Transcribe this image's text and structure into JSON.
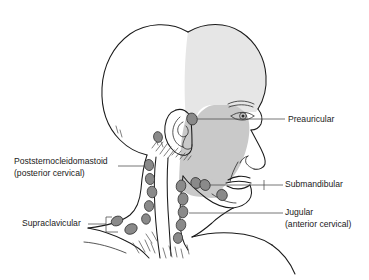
{
  "figure": {
    "colors": {
      "background": "#ffffff",
      "outline": "#1a1a1a",
      "node_fill": "#8a8a8a",
      "node_stroke": "#2f2f2f",
      "shade_light": "#e6e6e6",
      "shade_mid": "#c9c9c9",
      "leader_line": "#4a4a4a",
      "label_text": "#1a1a1a"
    }
  },
  "labels": [
    {
      "id": "preauricular",
      "line1": "Preauricular",
      "line2": "",
      "side": "right",
      "text_x": 288,
      "text_y": 120
    },
    {
      "id": "poststernocleidomastoid",
      "line1": "Poststernocleidomastoid",
      "line2": "(posterior cervical)",
      "side": "left",
      "text_x": 14,
      "text_y": 162
    },
    {
      "id": "submandibular",
      "line1": "Submandibular",
      "line2": "",
      "side": "right",
      "text_x": 285,
      "text_y": 185
    },
    {
      "id": "jugular",
      "line1": "Jugular",
      "line2": "(anterior cervical)",
      "side": "right",
      "text_x": 285,
      "text_y": 213
    },
    {
      "id": "supraclavicular",
      "line1": "Supraclavicular",
      "line2": "",
      "side": "left",
      "text_x": 22,
      "text_y": 224
    }
  ],
  "node_groups": [
    {
      "id": "preauricular",
      "count": 1,
      "nodes": [
        {
          "cx": 192,
          "cy": 119,
          "rx": 5.2,
          "ry": 6.0,
          "rot": -18
        }
      ]
    },
    {
      "id": "postauricular",
      "count": 1,
      "nodes": [
        {
          "cx": 158,
          "cy": 137,
          "rx": 4.4,
          "ry": 5.4,
          "rot": -12
        }
      ]
    },
    {
      "id": "poststernocleidomastoid",
      "count": 5,
      "nodes": [
        {
          "cx": 149,
          "cy": 165,
          "rx": 4.6,
          "ry": 5.6,
          "rot": -10
        },
        {
          "cx": 150,
          "cy": 179,
          "rx": 4.6,
          "ry": 5.6,
          "rot": -8
        },
        {
          "cx": 152,
          "cy": 192,
          "rx": 4.8,
          "ry": 5.8,
          "rot": -6
        },
        {
          "cx": 149,
          "cy": 206,
          "rx": 4.6,
          "ry": 5.4,
          "rot": -6
        },
        {
          "cx": 146,
          "cy": 219,
          "rx": 4.4,
          "ry": 5.2,
          "rot": -4
        }
      ]
    },
    {
      "id": "jugular",
      "count": 5,
      "nodes": [
        {
          "cx": 181,
          "cy": 186,
          "rx": 4.8,
          "ry": 6.0,
          "rot": 10
        },
        {
          "cx": 183,
          "cy": 199,
          "rx": 5.0,
          "ry": 6.2,
          "rot": 8
        },
        {
          "cx": 183,
          "cy": 212,
          "rx": 4.8,
          "ry": 5.8,
          "rot": 6
        },
        {
          "cx": 181,
          "cy": 225,
          "rx": 4.8,
          "ry": 5.8,
          "rot": 6
        },
        {
          "cx": 178,
          "cy": 238,
          "rx": 4.6,
          "ry": 5.4,
          "rot": 4
        }
      ]
    },
    {
      "id": "submandibular",
      "count": 3,
      "nodes": [
        {
          "cx": 196,
          "cy": 183,
          "rx": 5.0,
          "ry": 5.6,
          "rot": -30
        },
        {
          "cx": 205,
          "cy": 185,
          "rx": 5.0,
          "ry": 5.6,
          "rot": -30
        },
        {
          "cx": 222,
          "cy": 195,
          "rx": 5.2,
          "ry": 5.6,
          "rot": -28
        }
      ]
    },
    {
      "id": "supraclavicular",
      "count": 2,
      "nodes": [
        {
          "cx": 117,
          "cy": 221,
          "rx": 6.0,
          "ry": 4.6,
          "rot": -26
        },
        {
          "cx": 131,
          "cy": 229,
          "rx": 6.4,
          "ry": 5.0,
          "rot": -26
        }
      ]
    }
  ]
}
